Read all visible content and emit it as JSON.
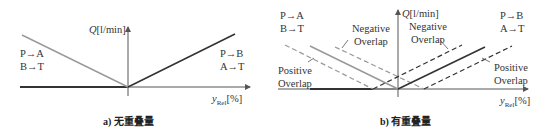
{
  "panel_a": {
    "caption": "a) 无重叠量",
    "y_axis_label_var": "Q",
    "y_axis_label_unit": "[l/min]",
    "x_axis_label_var": "y",
    "x_axis_label_sub": "Rel",
    "x_axis_label_unit": "[%]",
    "left_flow": [
      "P→A",
      "B→T"
    ],
    "right_flow": [
      "P→B",
      "A→T"
    ]
  },
  "panel_b": {
    "caption": "b) 有重叠量",
    "y_axis_label_var": "Q",
    "y_axis_label_unit": "[l/min]",
    "x_axis_label_var": "y",
    "x_axis_label_sub": "Rel",
    "x_axis_label_unit": "[%]",
    "left_flow": [
      "P→A",
      "B→T"
    ],
    "right_flow": [
      "P→B",
      "A→T"
    ],
    "annotations": {
      "negative_overlap_left": [
        "Negative",
        "Overlap"
      ],
      "negative_overlap_right": [
        "Negative",
        "Overlap"
      ],
      "positive_overlap_left": [
        "Positive",
        "Overlap"
      ],
      "positive_overlap_right": [
        "Positive",
        "Overlap"
      ]
    }
  },
  "colors": {
    "axis": "#555555",
    "left_line": "#9a9a9a",
    "right_line": "#333333",
    "baseline": "#333333"
  }
}
